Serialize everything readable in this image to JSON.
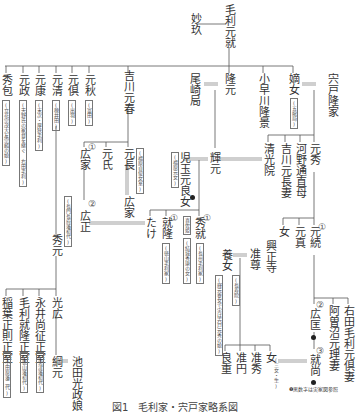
{
  "caption": "図1　毛利家・宍戸家略系図",
  "legend": "❶黒数字は実家図参照",
  "people": {
    "myokyu": "妙玖",
    "motonari": "毛利元就",
    "hidekane": "秀包",
    "motomasa": "元政",
    "motoyasu": "元康",
    "motokiyo": "元清",
    "mototomo": "元倶",
    "motoaki": "元秋",
    "kikkawa_motoharu": "吉川元春",
    "obasatsubone": "尾崎局",
    "takamoto": "隆元",
    "kobayakawa_takakage": "小早川隆景",
    "chakujo": "嫡女",
    "shishido_takaie": "宍戸隆家",
    "hiroie1": "広家",
    "motouji": "元氏",
    "motonaga": "元長",
    "hiroie2": "広家",
    "hiromasa": "広正",
    "hidemoto": "秀元",
    "terumoto": "輝元",
    "kodama_daughter": "児玉元良女",
    "seikoin": "清光院",
    "kikkawa_motonaga_tsuma": "吉川元長妻",
    "kono_michinao_haha": "河野通直母",
    "motohide": "元秀",
    "take": "たけ",
    "naritaka": "就隆",
    "hidenari": "秀就",
    "onna1": "女",
    "motozane": "元真",
    "mototsugu": "元続",
    "koshoji": "興正寺",
    "junson": "准尊",
    "yojo": "養女",
    "mitsuhiro": "光広",
    "tsunamoto": "綱元",
    "ikeda_musume": "池田光政娘",
    "inaba_seishitsu": "稲葉正則正室",
    "mori_naritaka_seishitsu": "毛利就隆正室",
    "nagai_seishitsu": "永井尚征正室",
    "hiromasa2": "広匡",
    "naritaka2": "就尚",
    "aso_tsuma": "阿曽沼元理妻",
    "migita_tsuma": "右田毛利元倶妻",
    "ryoju": "良重",
    "jun_en": "准円",
    "junshu": "准秀",
    "onna2": "女"
  },
  "notes": {
    "hidekane": "(立花宗茂大友宗麟の娘)",
    "motomasa": "(天野氏の家督を継ぐ 右田毛利)",
    "motoyasu": "(末次・厚狭毛利)",
    "motokiyo": "(穂井田)",
    "mototomo": "(出羽)",
    "motoaki": "(富田)",
    "motonaga": "(福原貞俊女室)",
    "kodama": "(福原元女)",
    "hidemoto": "(長門長府藩初代)",
    "chakujo": "(五龍局)",
    "hidenari_wife": "喜佐姫",
    "hidenari_wife_note": "(結城秀康の女)",
    "hidenari": "(長州毛利家)",
    "naritaka": "(徳山毛利家)",
    "yojo": "(長寿院)",
    "yojo2": "(輝元養女で実は宍戸元秀の娘)",
    "inaba": "(小田原藩二代)",
    "mori": "(徳山藩初代)",
    "nagai": "(宮津藩初代)",
    "onna2": "(三女・生)"
  },
  "numbers": {
    "hiroie1": "①",
    "hiromasa": "②",
    "naritaka": "①",
    "hidenari": "①",
    "mototsugu": "①",
    "hiromasa2": "②",
    "naritaka2": "③"
  }
}
